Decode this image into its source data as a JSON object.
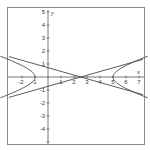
{
  "chart_data": {
    "type": "line",
    "title": "",
    "xlabel": "x",
    "ylabel": "y",
    "xlim": [
      -2.7,
      7.4
    ],
    "ylim": [
      -5.3,
      5.3
    ],
    "grid": false,
    "legend": null,
    "x_ticks": [
      -2,
      -1,
      1,
      2,
      3,
      4,
      5,
      6,
      7
    ],
    "y_ticks": [
      5,
      4,
      3,
      2,
      1,
      -1,
      -2,
      -3,
      -4,
      -5
    ],
    "x_tick_labels": [
      "-2",
      "-1",
      "1",
      "2",
      "3",
      "4",
      "5",
      "6",
      "7"
    ],
    "y_tick_labels": [
      "5",
      "4",
      "3",
      "2",
      "1",
      "-1",
      "-2",
      "-3",
      "-4"
    ],
    "series": [
      {
        "name": "hyperbola",
        "equation": "(x-2)^2/9 - y^2 = 1",
        "center": [
          2,
          0
        ],
        "vertices": [
          [
            -1,
            0
          ],
          [
            5,
            0
          ]
        ],
        "branches": [
          "left",
          "right"
        ]
      },
      {
        "name": "asymptote-1",
        "equation": "y = (x-2)/3",
        "x": [
          -2.7,
          7.3
        ],
        "y": [
          -1.57,
          1.77
        ]
      },
      {
        "name": "asymptote-2",
        "equation": "y = -(x-2)/3",
        "x": [
          -2.7,
          7.3
        ],
        "y": [
          1.57,
          -1.77
        ]
      }
    ],
    "colors": {
      "curve": "#4a4a4a",
      "axes": "#555555",
      "frame": "#888888"
    }
  },
  "labels": {
    "x_axis": "x",
    "y_axis": "y",
    "xt": [
      "-2",
      "-1",
      "1",
      "2",
      "3",
      "4",
      "5",
      "6",
      "7"
    ],
    "yt": [
      "5",
      "4",
      "3",
      "2",
      "1",
      "-1",
      "-2",
      "-3",
      "-4"
    ]
  }
}
